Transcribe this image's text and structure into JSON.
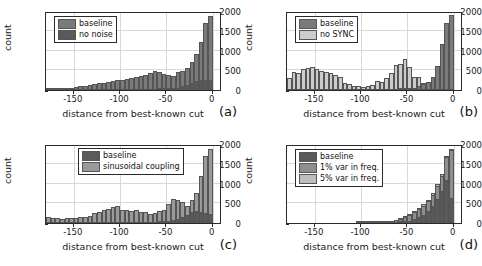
{
  "figure": {
    "type": "multi-panel-histogram-figure",
    "panels": 4,
    "layout": "2x2"
  },
  "axes": {
    "xlabel": "distance from best-known cut",
    "ylabel": "count",
    "xticks": [
      "-150",
      "-100",
      "-50",
      "0"
    ],
    "xtick_values": [
      -150,
      -100,
      -50,
      0
    ],
    "yticks": [
      "0",
      "500",
      "1000",
      "1500",
      "2000"
    ],
    "ytick_values": [
      0,
      500,
      1000,
      1500,
      2000
    ],
    "xlim": [
      -180,
      10
    ],
    "ylim": [
      0,
      2000
    ],
    "grid": true
  },
  "colors": {
    "baseline": "#7a7a7a",
    "variant_light": "#d0d0d0",
    "variant_mid": "#a8a8a8",
    "axis": "#2a2a2a",
    "grid": "#d8d8d8",
    "background": "#ffffff"
  },
  "chart_data": [
    {
      "type": "bar",
      "panel": "a",
      "tag": "(a)",
      "title": "",
      "xlabel": "distance from best-known cut",
      "ylabel": "count",
      "xlim": [
        -180,
        10
      ],
      "ylim": [
        0,
        2000
      ],
      "grid": true,
      "legend_position": "upper-left",
      "legend": [
        "baseline",
        "no noise"
      ],
      "bin_width": 5,
      "x": [
        -177.5,
        -172.5,
        -167.5,
        -162.5,
        -157.5,
        -152.5,
        -147.5,
        -142.5,
        -137.5,
        -132.5,
        -127.5,
        -122.5,
        -117.5,
        -112.5,
        -107.5,
        -102.5,
        -97.5,
        -92.5,
        -87.5,
        -82.5,
        -77.5,
        -72.5,
        -67.5,
        -62.5,
        -57.5,
        -52.5,
        -47.5,
        -42.5,
        -37.5,
        -32.5,
        -27.5,
        -22.5,
        -17.5,
        -12.5,
        -7.5,
        -2.5
      ],
      "series": [
        {
          "name": "baseline",
          "color": "#7a7a7a",
          "values": [
            10,
            15,
            20,
            30,
            45,
            55,
            70,
            95,
            110,
            130,
            150,
            175,
            190,
            215,
            230,
            250,
            265,
            280,
            300,
            320,
            345,
            390,
            430,
            490,
            455,
            400,
            380,
            365,
            460,
            470,
            560,
            700,
            900,
            1220,
            1700,
            1880
          ]
        },
        {
          "name": "no noise",
          "color": "#5a5a5a",
          "values": [
            0,
            0,
            0,
            0,
            0,
            0,
            0,
            0,
            0,
            0,
            0,
            0,
            0,
            0,
            0,
            0,
            0,
            0,
            0,
            0,
            0,
            0,
            0,
            0,
            5,
            10,
            20,
            35,
            60,
            90,
            130,
            175,
            225,
            265,
            250,
            245
          ]
        }
      ]
    },
    {
      "type": "bar",
      "panel": "b",
      "tag": "(b)",
      "title": "",
      "xlabel": "distance from best-known cut",
      "ylabel": "count",
      "xlim": [
        -180,
        10
      ],
      "ylim": [
        0,
        2000
      ],
      "grid": true,
      "legend_position": "upper-left",
      "legend": [
        "baseline",
        "no SYNC"
      ],
      "bin_width": 5,
      "x": [
        -177.5,
        -172.5,
        -167.5,
        -162.5,
        -157.5,
        -152.5,
        -147.5,
        -142.5,
        -137.5,
        -132.5,
        -127.5,
        -122.5,
        -117.5,
        -112.5,
        -107.5,
        -102.5,
        -97.5,
        -92.5,
        -87.5,
        -82.5,
        -77.5,
        -72.5,
        -67.5,
        -62.5,
        -57.5,
        -52.5,
        -47.5,
        -42.5,
        -37.5,
        -32.5,
        -27.5,
        -22.5,
        -17.5,
        -12.5,
        -7.5,
        -2.5
      ],
      "series": [
        {
          "name": "no SYNC",
          "color": "#cccccc",
          "values": [
            310,
            450,
            430,
            540,
            545,
            590,
            520,
            490,
            465,
            440,
            375,
            340,
            165,
            155,
            100,
            95,
            85,
            110,
            130,
            225,
            215,
            300,
            420,
            640,
            650,
            790,
            595,
            325,
            325,
            180,
            185,
            210,
            265,
            290,
            300,
            290
          ]
        },
        {
          "name": "baseline",
          "color": "#7a7a7a",
          "values": [
            0,
            0,
            0,
            0,
            0,
            0,
            0,
            0,
            0,
            0,
            0,
            0,
            0,
            0,
            0,
            0,
            0,
            0,
            0,
            0,
            0,
            0,
            0,
            0,
            5,
            10,
            25,
            50,
            90,
            140,
            210,
            330,
            620,
            1170,
            1700,
            1900
          ]
        }
      ]
    },
    {
      "type": "bar",
      "panel": "c",
      "tag": "(c)",
      "title": "",
      "xlabel": "distance from best-known cut",
      "ylabel": "count",
      "xlim": [
        -180,
        10
      ],
      "ylim": [
        0,
        2000
      ],
      "grid": true,
      "legend_position": "upper-center",
      "legend": [
        "baseline",
        "sinusoidal coupling"
      ],
      "bin_width": 5,
      "x": [
        -177.5,
        -172.5,
        -167.5,
        -162.5,
        -157.5,
        -152.5,
        -147.5,
        -142.5,
        -137.5,
        -132.5,
        -127.5,
        -122.5,
        -117.5,
        -112.5,
        -107.5,
        -102.5,
        -97.5,
        -92.5,
        -87.5,
        -82.5,
        -77.5,
        -72.5,
        -67.5,
        -62.5,
        -57.5,
        -52.5,
        -47.5,
        -42.5,
        -37.5,
        -32.5,
        -27.5,
        -22.5,
        -17.5,
        -12.5,
        -7.5,
        -2.5
      ],
      "series": [
        {
          "name": "sinusoidal coupling",
          "color": "#9a9a9a",
          "values": [
            150,
            130,
            115,
            110,
            115,
            125,
            120,
            140,
            150,
            190,
            260,
            290,
            330,
            350,
            400,
            420,
            330,
            320,
            300,
            340,
            290,
            280,
            240,
            260,
            300,
            330,
            470,
            600,
            580,
            520,
            430,
            590,
            760,
            1180,
            1700,
            1880
          ]
        },
        {
          "name": "baseline",
          "color": "#5a5a5a",
          "values": [
            0,
            0,
            0,
            0,
            0,
            0,
            0,
            0,
            0,
            0,
            0,
            0,
            0,
            0,
            0,
            0,
            0,
            0,
            0,
            0,
            0,
            0,
            0,
            0,
            10,
            20,
            40,
            70,
            110,
            150,
            210,
            280,
            300,
            280,
            250,
            230
          ]
        }
      ]
    },
    {
      "type": "bar",
      "panel": "d",
      "tag": "(d)",
      "title": "",
      "xlabel": "distance from best-known cut",
      "ylabel": "count",
      "xlim": [
        -180,
        10
      ],
      "ylim": [
        0,
        2000
      ],
      "grid": true,
      "legend_position": "upper-left",
      "legend": [
        "baseline",
        "1% var in freq.",
        "5% var in freq."
      ],
      "bin_width": 5,
      "x": [
        -177.5,
        -172.5,
        -167.5,
        -162.5,
        -157.5,
        -152.5,
        -147.5,
        -142.5,
        -137.5,
        -132.5,
        -127.5,
        -122.5,
        -117.5,
        -112.5,
        -107.5,
        -102.5,
        -97.5,
        -92.5,
        -87.5,
        -82.5,
        -77.5,
        -72.5,
        -67.5,
        -62.5,
        -57.5,
        -52.5,
        -47.5,
        -42.5,
        -37.5,
        -32.5,
        -27.5,
        -22.5,
        -17.5,
        -12.5,
        -7.5,
        -2.5
      ],
      "series": [
        {
          "name": "5% var in freq.",
          "color": "#bdbdbd",
          "values": [
            0,
            0,
            0,
            0,
            0,
            0,
            0,
            0,
            0,
            0,
            0,
            0,
            0,
            0,
            0,
            5,
            8,
            10,
            15,
            20,
            30,
            45,
            60,
            80,
            130,
            175,
            230,
            300,
            380,
            470,
            590,
            760,
            980,
            1240,
            1700,
            1880
          ]
        },
        {
          "name": "1% var in freq.",
          "color": "#8e8e8e",
          "values": [
            0,
            0,
            0,
            0,
            0,
            0,
            0,
            0,
            0,
            0,
            0,
            0,
            0,
            0,
            0,
            0,
            0,
            5,
            10,
            15,
            25,
            35,
            50,
            70,
            110,
            150,
            200,
            270,
            350,
            440,
            560,
            720,
            940,
            1200,
            1660,
            1860
          ]
        },
        {
          "name": "baseline",
          "color": "#5a5a5a",
          "values": [
            0,
            0,
            0,
            0,
            0,
            0,
            0,
            0,
            0,
            0,
            0,
            0,
            0,
            0,
            0,
            0,
            0,
            0,
            0,
            0,
            0,
            0,
            0,
            0,
            10,
            25,
            50,
            90,
            140,
            210,
            300,
            420,
            600,
            820,
            1100,
            640
          ]
        }
      ]
    }
  ]
}
